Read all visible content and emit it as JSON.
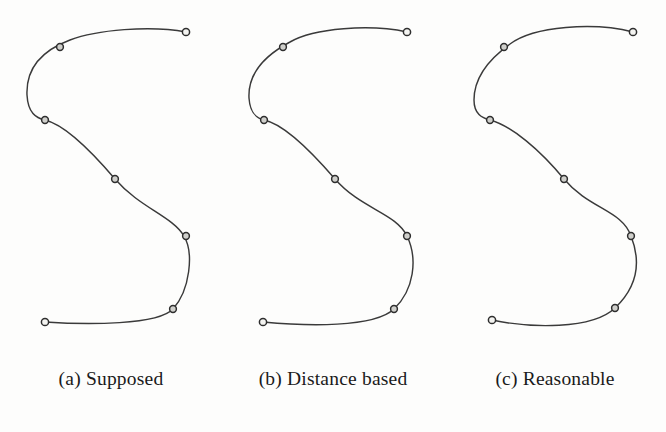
{
  "figure": {
    "background_color": "#fdfdfc",
    "curve_color": "#3a3a3a",
    "knot_fill_color": "#cfcfcb",
    "knot_stroke_color": "#2e2e2e",
    "caption_color": "#1a1a1a"
  },
  "panels": [
    {
      "id": "a",
      "caption": "(a) Supposed",
      "curve_name": "supposed-curve",
      "knot_count": 7
    },
    {
      "id": "b",
      "caption": "(b) Distance based",
      "curve_name": "distance-based-curve",
      "knot_count": 7
    },
    {
      "id": "c",
      "caption": "(c) Reasonable",
      "curve_name": "reasonable-curve",
      "knot_count": 7
    }
  ],
  "chart_data": {
    "type": "line",
    "title": "",
    "xlabel": "",
    "ylabel": "",
    "grid": false,
    "legend": "none",
    "xlim": [
      0,
      222
    ],
    "ylim": [
      0,
      350
    ],
    "note": "Three S-shaped parametric interpolating curves through identical 7 data points; panels differ in parameterization method.",
    "series": [
      {
        "name": "(a) Supposed",
        "knots": [
          [
            186,
            32
          ],
          [
            60,
            47
          ],
          [
            45,
            120
          ],
          [
            115,
            179
          ],
          [
            186,
            236
          ],
          [
            173,
            309
          ],
          [
            45,
            322
          ]
        ],
        "path": "M186,32 C150,25 96,30 70,40 C38,52 26,72 27,95 C28,113 36,118 45,120 C66,125 92,152 115,179 C140,208 172,216 184,236 C194,253 190,290 173,309 C158,325 88,325 45,322"
      },
      {
        "name": "(b) Distance based",
        "knots": [
          [
            185,
            32
          ],
          [
            61,
            47
          ],
          [
            42,
            120
          ],
          [
            113,
            179
          ],
          [
            185,
            236
          ],
          [
            172,
            309
          ],
          [
            41,
            322
          ]
        ],
        "path": "M185,32 C148,24 92,28 68,42 C38,58 26,78 27,98 C28,113 34,118 42,120 C62,124 88,150 113,179 C139,209 174,213 185,236 C196,259 192,290 172,309 C152,328 84,326 41,322"
      },
      {
        "name": "(c) Reasonable",
        "knots": [
          [
            189,
            32
          ],
          [
            60,
            47
          ],
          [
            46,
            120
          ],
          [
            120,
            179
          ],
          [
            187,
            236
          ],
          [
            171,
            308
          ],
          [
            48,
            320
          ]
        ],
        "path": "M189,32 C150,22 90,26 66,44 C38,64 30,84 30,100 C30,114 38,118 46,120 C68,126 96,150 120,179 C145,209 178,210 187,236 C198,264 192,288 171,308 C148,330 86,328 48,320"
      }
    ]
  }
}
